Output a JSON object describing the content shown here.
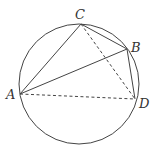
{
  "diagram": {
    "type": "geometry",
    "circle": {
      "cx": 79,
      "cy": 84,
      "r": 60
    },
    "points": {
      "A": {
        "x": 20,
        "y": 94,
        "label": "A",
        "lx": 6,
        "ly": 99
      },
      "C": {
        "x": 81,
        "y": 24,
        "label": "C",
        "lx": 75,
        "ly": 19
      },
      "B": {
        "x": 127,
        "y": 49,
        "label": "B",
        "lx": 131,
        "ly": 52
      },
      "D": {
        "x": 135,
        "y": 99,
        "label": "D",
        "lx": 139,
        "ly": 108
      }
    },
    "solid_segments": [
      "AC",
      "CB",
      "AB",
      "BD"
    ],
    "dashed_segments": [
      "AD",
      "CD"
    ],
    "colors": {
      "stroke": "#444444",
      "label": "#333333"
    }
  }
}
